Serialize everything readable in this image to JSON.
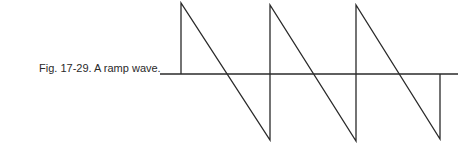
{
  "figure": {
    "caption": "Fig. 17-29. A ramp wave.",
    "stroke_color": "#2a2a2a"
  },
  "waveform": {
    "type": "ramp (sawtooth)",
    "axis": {
      "x1": 160,
      "x2": 458,
      "y": 74
    },
    "points": [
      [
        181,
        74
      ],
      [
        181,
        3
      ],
      [
        270,
        140
      ],
      [
        270,
        5
      ],
      [
        356,
        141
      ],
      [
        356,
        5
      ],
      [
        440,
        139
      ],
      [
        440,
        74
      ]
    ]
  }
}
